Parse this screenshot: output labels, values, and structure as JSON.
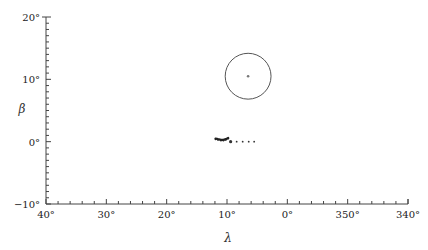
{
  "chart_data": {
    "type": "scatter",
    "title": "",
    "xlabel": "λ",
    "ylabel": "β",
    "xlim": [
      40,
      -20
    ],
    "ylim": [
      -10,
      20
    ],
    "x_ticks": [
      {
        "value": 40,
        "label": "40°"
      },
      {
        "value": 30,
        "label": "30°"
      },
      {
        "value": 20,
        "label": "20°"
      },
      {
        "value": 10,
        "label": "10°"
      },
      {
        "value": 0,
        "label": "0°"
      },
      {
        "value": -10,
        "label": "350°"
      },
      {
        "value": -20,
        "label": "340°"
      }
    ],
    "y_ticks": [
      {
        "value": 20,
        "label": "20°"
      },
      {
        "value": 10,
        "label": "10°"
      },
      {
        "value": 0,
        "label": "0°"
      },
      {
        "value": -10,
        "label": "−10°"
      }
    ],
    "grid": false,
    "legend": null,
    "series": [
      {
        "name": "circle",
        "kind": "circle",
        "center": {
          "lambda": 6.5,
          "beta": 10.5
        },
        "radius_deg": 3.8,
        "color": "#555555"
      },
      {
        "name": "circle-center",
        "kind": "point",
        "lambda": 6.5,
        "beta": 10.5,
        "color": "#777777"
      },
      {
        "name": "track-cluster",
        "kind": "cluster",
        "points": [
          {
            "lambda": 11.9,
            "beta": 0.5
          },
          {
            "lambda": 11.5,
            "beta": 0.4
          },
          {
            "lambda": 11.0,
            "beta": 0.3
          },
          {
            "lambda": 10.6,
            "beta": 0.3
          },
          {
            "lambda": 10.2,
            "beta": 0.4
          },
          {
            "lambda": 9.8,
            "beta": 0.6
          }
        ],
        "color": "#222222"
      },
      {
        "name": "dotted-trail",
        "kind": "dotted",
        "points": [
          {
            "lambda": 9.4,
            "beta": 0.0
          },
          {
            "lambda": 8.4,
            "beta": 0.0
          },
          {
            "lambda": 7.4,
            "beta": 0.0
          },
          {
            "lambda": 6.4,
            "beta": 0.0
          },
          {
            "lambda": 5.5,
            "beta": 0.0
          }
        ],
        "color": "#333333"
      }
    ]
  }
}
